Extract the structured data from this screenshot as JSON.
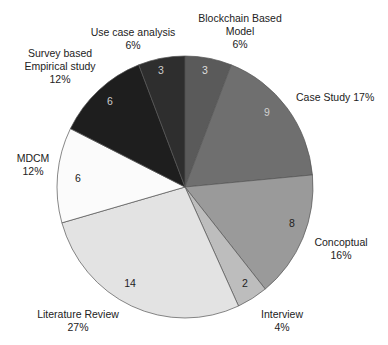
{
  "chart_data": {
    "type": "pie",
    "title": "",
    "start_angle": "12 o'clock, clockwise",
    "center": [
      185,
      187
    ],
    "radius": [
      128,
      131
    ],
    "total": 51,
    "slices": [
      {
        "name": "Blockchain Based Model",
        "value": 3,
        "percent": "6%",
        "color": "#5a5a5a",
        "value_color": "#dddddd",
        "label_lines": [
          "Blockchain Based",
          "Model",
          "6%"
        ],
        "label_pos": [
          240,
          22
        ],
        "anchor": "middle",
        "value_pos": [
          205,
          74
        ]
      },
      {
        "name": "Case Study",
        "value": 9,
        "percent": "17%",
        "color": "#6f6f6f",
        "value_color": "#d0d0d0",
        "label_lines": [
          "Case Study 17%"
        ],
        "label_pos": [
          296,
          101
        ],
        "anchor": "start",
        "value_pos": [
          267,
          116
        ]
      },
      {
        "name": "Concoptual",
        "value": 8,
        "percent": "16%",
        "color": "#9a9a9a",
        "value_color": "#222222",
        "label_lines": [
          "Concoptual",
          "16%"
        ],
        "label_pos": [
          341,
          246
        ],
        "anchor": "middle",
        "value_pos": [
          292,
          227
        ]
      },
      {
        "name": "Interview",
        "value": 2,
        "percent": "4%",
        "color": "#bdbdbd",
        "value_color": "#222222",
        "label_lines": [
          "Interview",
          "4%"
        ],
        "label_pos": [
          282,
          318
        ],
        "anchor": "middle",
        "value_pos": [
          245,
          287
        ]
      },
      {
        "name": "Literature Review",
        "value": 14,
        "percent": "27%",
        "color": "#e3e3e3",
        "value_color": "#222222",
        "label_lines": [
          "Literature Review",
          "27%"
        ],
        "label_pos": [
          78,
          318
        ],
        "anchor": "middle",
        "value_pos": [
          130,
          287
        ]
      },
      {
        "name": "MDCM",
        "value": 6,
        "percent": "12%",
        "color": "#fbfbfb",
        "value_color": "#222222",
        "label_lines": [
          "MDCM",
          "12%"
        ],
        "label_pos": [
          33,
          162
        ],
        "anchor": "middle",
        "value_pos": [
          78,
          182
        ]
      },
      {
        "name": "Survey based Empirical study",
        "value": 6,
        "percent": "12%",
        "color": "#1e1e1e",
        "value_color": "#cccccc",
        "label_lines": [
          "Survey based",
          "Empirical study",
          "12%"
        ],
        "label_pos": [
          60,
          57
        ],
        "anchor": "middle",
        "value_pos": [
          110,
          105
        ]
      },
      {
        "name": "Use case analysis",
        "value": 3,
        "percent": "6%",
        "color": "#2e2e2e",
        "value_color": "#cccccc",
        "label_lines": [
          "Use case analysis",
          "6%"
        ],
        "label_pos": [
          133,
          36
        ],
        "anchor": "middle",
        "value_pos": [
          161,
          74
        ]
      }
    ],
    "legend": "none (direct labels)",
    "grid": false
  }
}
